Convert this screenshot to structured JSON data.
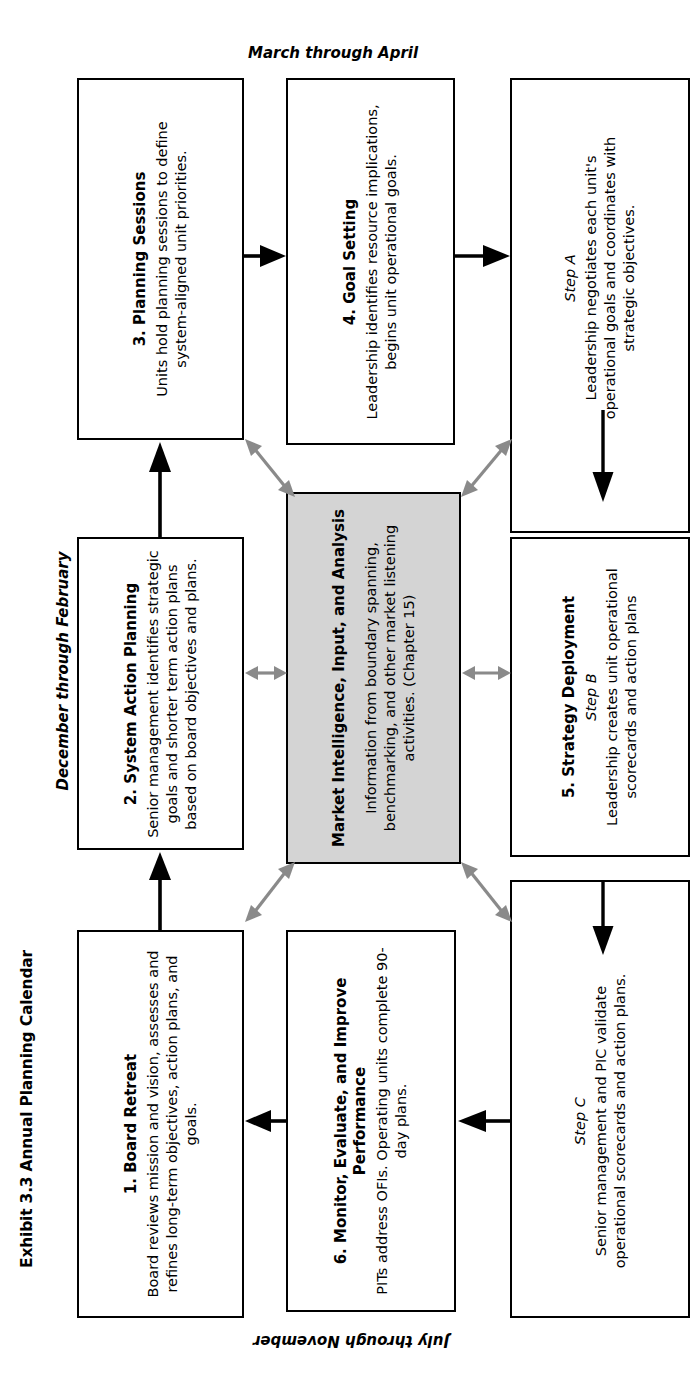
{
  "exhibit": {
    "title": "Exhibit 3.3 Annual Planning Calendar"
  },
  "periods": {
    "top": "March through April",
    "left": "December through February",
    "right": "May through June",
    "bottom": "July through November"
  },
  "boxes": {
    "planning_sessions": {
      "heading": "3. Planning Sessions",
      "body": "Units hold planning sessions to define system-aligned unit priorities."
    },
    "goal_setting": {
      "heading": "4. Goal Setting",
      "body": "Leadership identifies resource implications, begins unit operational goals."
    },
    "step_a": {
      "step": "Step A",
      "body": "Leadership negotiates each unit's operational goals and coordinates with strategic objectives."
    },
    "system_action_planning": {
      "heading": "2. System Action Planning",
      "body": "Senior management identifies strategic goals and shorter term action plans based on board objectives and plans."
    },
    "market_intelligence": {
      "heading": "Market Intelligence, Input, and Analysis",
      "body": "Information from boundary spanning, benchmarking, and other market listening activities. (Chapter 15)",
      "fill": "#d4d4d4"
    },
    "strategy_deployment": {
      "heading": "5. Strategy Deployment",
      "step": "Step B",
      "body": "Leadership creates unit operational scorecards and action plans"
    },
    "board_retreat": {
      "heading": "1. Board Retreat",
      "body": "Board reviews mission and vision, assesses and refines long-term objectives, action plans, and goals."
    },
    "monitor_evaluate": {
      "heading": "6. Monitor, Evaluate, and Improve Performance",
      "body": "PITs address OFIs. Operating units complete 90-day plans."
    },
    "step_c": {
      "step": "Step C",
      "body": "Senior management and PIC validate operational scorecards and action plans."
    }
  },
  "colors": {
    "stroke": "#000000",
    "gray_arrow": "#8a8a8a",
    "gray_fill": "#d4d4d4",
    "background": "#ffffff"
  }
}
